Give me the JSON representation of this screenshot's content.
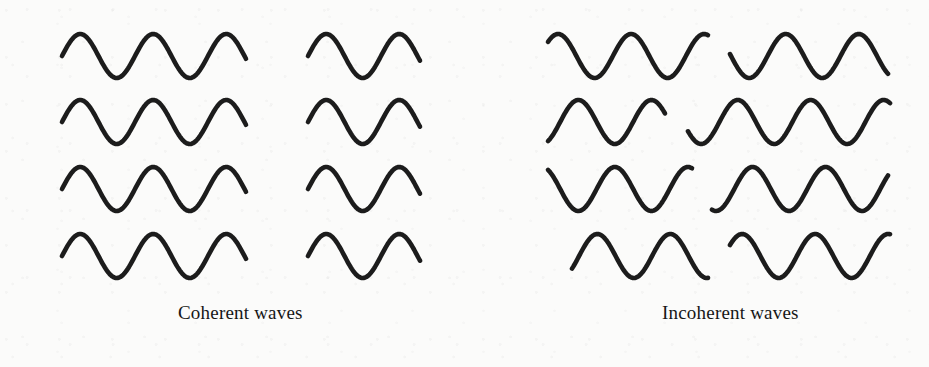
{
  "figure": {
    "kind": "physics-illustration",
    "ink_color": "#1c1c1c",
    "paper_color": "#fbfbfa"
  },
  "groups": [
    {
      "id": "coherent",
      "caption": "Coherent waves",
      "description": "Four wave trains drawn in phase with one another; every crest lines up vertically.",
      "rows": 4,
      "segments_per_row": 2,
      "wavelength_px": 73,
      "amplitude_px": 22,
      "in_phase": true,
      "phase_offsets_deg": [
        0,
        0,
        0,
        0
      ],
      "waves": [
        {
          "row": 1,
          "segments": [
            {
              "x_start": 62,
              "x_end": 246,
              "y_center": 56,
              "phase_deg": 0
            },
            {
              "x_start": 308,
              "x_end": 420,
              "y_center": 56,
              "phase_deg": 0
            }
          ]
        },
        {
          "row": 2,
          "segments": [
            {
              "x_start": 62,
              "x_end": 246,
              "y_center": 122,
              "phase_deg": 0
            },
            {
              "x_start": 308,
              "x_end": 420,
              "y_center": 122,
              "phase_deg": 0
            }
          ]
        },
        {
          "row": 3,
          "segments": [
            {
              "x_start": 62,
              "x_end": 246,
              "y_center": 189,
              "phase_deg": 0
            },
            {
              "x_start": 308,
              "x_end": 420,
              "y_center": 189,
              "phase_deg": 0
            }
          ]
        },
        {
          "row": 4,
          "segments": [
            {
              "x_start": 62,
              "x_end": 246,
              "y_center": 256,
              "phase_deg": 0
            },
            {
              "x_start": 308,
              "x_end": 420,
              "y_center": 256,
              "phase_deg": 0
            }
          ]
        }
      ]
    },
    {
      "id": "incoherent",
      "caption": "Incoherent waves",
      "description": "Four wave trains drawn with random relative phases; crests do not line up.",
      "rows": 4,
      "segments_per_row": 2,
      "wavelength_px": 73,
      "amplitude_px": 22,
      "in_phase": false,
      "phase_offsets_deg": [
        30,
        95,
        205,
        300
      ],
      "waves": [
        {
          "row": 1,
          "segments": [
            {
              "x_start": 548,
              "x_end": 708,
              "y_center": 56,
              "phase_deg": 40
            },
            {
              "x_start": 730,
              "x_end": 888,
              "y_center": 56,
              "phase_deg": 175
            }
          ]
        },
        {
          "row": 2,
          "segments": [
            {
              "x_start": 548,
              "x_end": 665,
              "y_center": 122,
              "phase_deg": 300
            },
            {
              "x_start": 688,
              "x_end": 890,
              "y_center": 122,
              "phase_deg": 205
            }
          ]
        },
        {
          "row": 3,
          "segments": [
            {
              "x_start": 548,
              "x_end": 692,
              "y_center": 189,
              "phase_deg": 120
            },
            {
              "x_start": 712,
              "x_end": 888,
              "y_center": 189,
              "phase_deg": 250
            }
          ]
        },
        {
          "row": 4,
          "segments": [
            {
              "x_start": 572,
              "x_end": 708,
              "y_center": 256,
              "phase_deg": 325
            },
            {
              "x_start": 730,
              "x_end": 890,
              "y_center": 256,
              "phase_deg": 30
            }
          ]
        }
      ]
    }
  ]
}
